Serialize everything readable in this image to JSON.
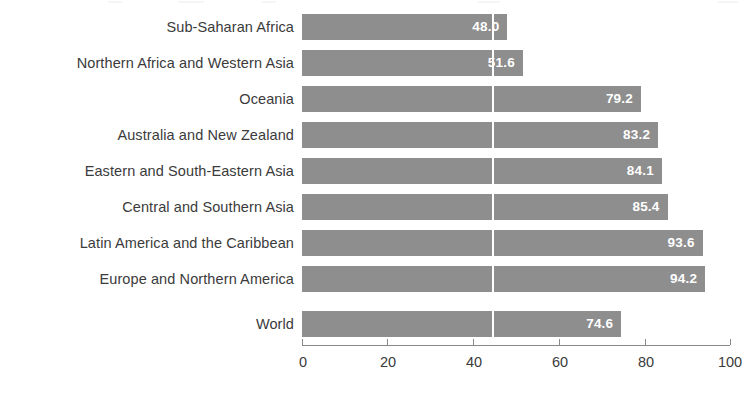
{
  "chart_data": {
    "type": "bar",
    "orientation": "horizontal",
    "title": "",
    "subtitle": "",
    "xlabel": "",
    "ylabel": "",
    "xlim": [
      0,
      100
    ],
    "grid": false,
    "legend": null,
    "bar_color": "#8e8e8e",
    "value_label_color": "#ffffff",
    "axis_color": "#8a8a8a",
    "text_color": "#3b3b3b",
    "reference_line": {
      "value": 44.5,
      "color": "#ffffff",
      "label": ""
    },
    "xticks": [
      0,
      20,
      40,
      60,
      80,
      100
    ],
    "xtick_labels": [
      "0",
      "20",
      "40",
      "60",
      "80",
      "100"
    ],
    "categories": [
      "Sub-Saharan Africa",
      "Northern Africa and Western Asia",
      "Oceania",
      "Australia and New Zealand",
      "Eastern and South-Eastern Asia",
      "Central and Southern Asia",
      "Latin America and the Caribbean",
      "Europe and Northern America",
      "World"
    ],
    "values": [
      48.0,
      51.6,
      79.2,
      83.2,
      84.1,
      85.4,
      93.6,
      94.2,
      74.6
    ],
    "value_labels": [
      "48.0",
      "51.6",
      "79.2",
      "83.2",
      "84.1",
      "85.4",
      "93.6",
      "94.2",
      "74.6"
    ],
    "bars": [
      {
        "category": "Sub-Saharan Africa",
        "value": 48.0,
        "label": "48.0",
        "group": "regions"
      },
      {
        "category": "Northern Africa and Western Asia",
        "value": 51.6,
        "label": "51.6",
        "group": "regions"
      },
      {
        "category": "Oceania",
        "value": 79.2,
        "label": "79.2",
        "group": "regions"
      },
      {
        "category": "Australia and New Zealand",
        "value": 83.2,
        "label": "83.2",
        "group": "regions"
      },
      {
        "category": "Eastern and South-Eastern Asia",
        "value": 84.1,
        "label": "84.1",
        "group": "regions"
      },
      {
        "category": "Central and Southern Asia",
        "value": 85.4,
        "label": "85.4",
        "group": "regions"
      },
      {
        "category": "Latin America and the Caribbean",
        "value": 93.6,
        "label": "93.6",
        "group": "regions"
      },
      {
        "category": "Europe and Northern America",
        "value": 94.2,
        "label": "94.2",
        "group": "regions"
      },
      {
        "category": "World",
        "value": 74.6,
        "label": "74.6",
        "group": "world"
      }
    ]
  }
}
